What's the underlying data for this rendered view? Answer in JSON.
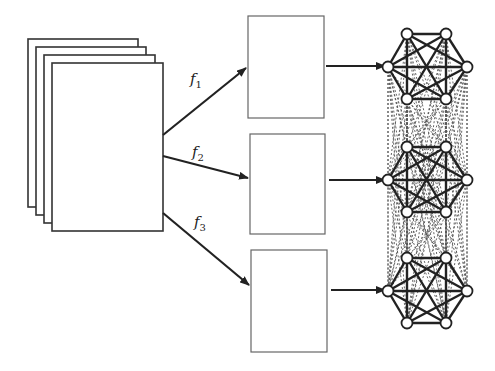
{
  "diagram": {
    "input_stack": {
      "page_count": 4
    },
    "functions": [
      {
        "label": "f",
        "subscript": "1"
      },
      {
        "label": "f",
        "subscript": "2"
      },
      {
        "label": "f",
        "subscript": "3"
      }
    ],
    "blocks": [
      {
        "id": "block-1"
      },
      {
        "id": "block-2"
      },
      {
        "id": "block-3"
      }
    ],
    "graphs": [
      {
        "id": "graph-1",
        "nodes": 6,
        "type": "complete"
      },
      {
        "id": "graph-2",
        "nodes": 6,
        "type": "complete"
      },
      {
        "id": "graph-3",
        "nodes": 6,
        "type": "complete"
      }
    ],
    "inter_graph_edges": "dashed",
    "colors": {
      "stroke": "#222222",
      "box_stroke": "#555555",
      "dashed": "#555555",
      "background": "#ffffff"
    }
  }
}
